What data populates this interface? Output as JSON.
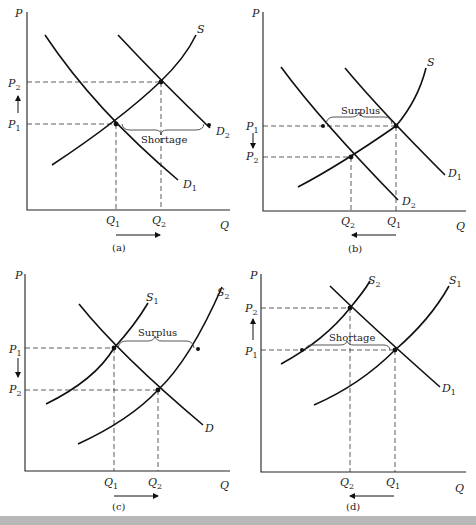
{
  "panels": [
    {
      "id": "a",
      "caption": "(a)",
      "annotation": "Shortage",
      "supply": [
        "S"
      ],
      "demand": [
        "D1",
        "D2"
      ],
      "prices": [
        "P2",
        "P1"
      ],
      "quantities": [
        "Q1",
        "Q2"
      ],
      "price_arrow": "up",
      "quantity_arrow": "right"
    },
    {
      "id": "b",
      "caption": "(b)",
      "annotation": "Surplus",
      "supply": [
        "S"
      ],
      "demand": [
        "D1",
        "D2"
      ],
      "prices": [
        "P1",
        "P2"
      ],
      "quantities": [
        "Q2",
        "Q1"
      ],
      "price_arrow": "down",
      "quantity_arrow": "left"
    },
    {
      "id": "c",
      "caption": "(c)",
      "annotation": "Surplus",
      "supply": [
        "S1",
        "S2"
      ],
      "demand": [
        "D"
      ],
      "prices": [
        "P1",
        "P2"
      ],
      "quantities": [
        "Q1",
        "Q2"
      ],
      "price_arrow": "down",
      "quantity_arrow": "right"
    },
    {
      "id": "d",
      "caption": "(d)",
      "annotation": "Shortage",
      "supply": [
        "S2",
        "S1"
      ],
      "demand": [
        "D1"
      ],
      "prices": [
        "P2",
        "P1"
      ],
      "quantities": [
        "Q2",
        "Q1"
      ],
      "price_arrow": "up",
      "quantity_arrow": "left"
    }
  ],
  "axes": {
    "y": "P",
    "x": "Q"
  },
  "labels": {
    "a": {
      "shortage": "Shortage",
      "cap": "(a)"
    },
    "b": {
      "surplus": "Surplus",
      "cap": "(b)"
    },
    "c": {
      "surplus": "Surplus",
      "cap": "(c)"
    },
    "d": {
      "shortage": "Shortage",
      "cap": "(d)"
    }
  }
}
